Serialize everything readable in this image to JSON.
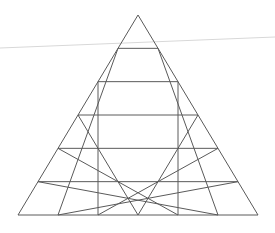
{
  "diagram": {
    "type": "triangular-grid",
    "rows": 6,
    "apex": [
      138,
      15
    ],
    "base_left": [
      18,
      215
    ],
    "base_right": [
      258,
      215
    ],
    "line_color": "#5a5a5a",
    "line_width": 1,
    "background": "#ffffff",
    "artifact_line": {
      "from": [
        0,
        48
      ],
      "to": [
        275,
        37
      ],
      "color": "#d8d8d8"
    }
  }
}
